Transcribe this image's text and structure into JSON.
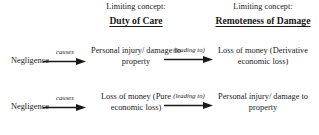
{
  "columns": {
    "left_heading": {
      "kicker": "Limiting concept:",
      "title": "Duty of Care"
    },
    "right_heading": {
      "kicker": "Limiting concept:",
      "title": "Remoteness of Damage"
    }
  },
  "rows": [
    {
      "source": "Negligence",
      "first_arrow_label": "causes",
      "middle": "Personal injury/ damage to property",
      "second_arrow_label": "(leading to)",
      "outcome": "Loss of money (Derivative economic loss)"
    },
    {
      "source": "Negligence",
      "first_arrow_label": "causes",
      "middle": "Loss of money (Pure economic loss)",
      "second_arrow_label": "(leading to)",
      "outcome": "Personal injury/ damage to property"
    }
  ],
  "style": {
    "background": "#ffffff",
    "text_color": "#1a1a1a",
    "arrow_color": "#1a1a1a"
  }
}
